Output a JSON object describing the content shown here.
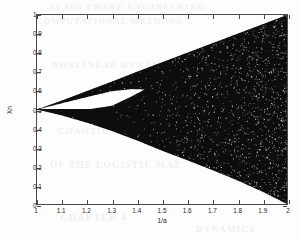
{
  "figure": {
    "background_color": "#fdfdfd",
    "ink_color": "#0d0d0d",
    "axis_color": "#4a4a4a"
  },
  "ghost_text": {
    "line1": "AI SOFTWARE ENGINEERING",
    "line2": "COMPUTATIONAL METHODS",
    "line3": "NONLINEAR DYNAMICS AND",
    "line4": "BIFURCATION",
    "line5": "CHAOTIC BEHAVIOUR",
    "line6": "OF THE LOGISTIC MAP",
    "line7": "CHAPTER 4",
    "line8": "DYNAMICS"
  },
  "chart_data": {
    "type": "scatter",
    "title": "",
    "xlabel": "1/a",
    "ylabel": "Xn",
    "xlim": [
      1,
      2
    ],
    "ylim": [
      0,
      1
    ],
    "grid": false,
    "legend": "none",
    "xticks": [
      1,
      1.1,
      1.2,
      1.3,
      1.4,
      1.5,
      1.6,
      1.7,
      1.8,
      1.9,
      2
    ],
    "xticklabels": [
      "1",
      "1.1",
      "1.2",
      "1.3",
      "1.4",
      "1.5",
      "1.6",
      "1.7",
      "1.8",
      "1.9",
      "2"
    ],
    "yticks": [
      0,
      0.1,
      0.2,
      0.3,
      0.4,
      0.5,
      0.6,
      0.7,
      0.8,
      0.9,
      1
    ],
    "yticklabels": [
      "0",
      "0.1",
      "0.2",
      "0.3",
      "0.4",
      "0.5",
      "0.6",
      "0.7",
      "0.8",
      "0.9",
      "1"
    ],
    "marker_color": "#0d0d0d",
    "upper_envelope": {
      "x": [
        1.0,
        1.1,
        1.2,
        1.3,
        1.4,
        1.5,
        1.6,
        1.7,
        1.8,
        1.9,
        2.0
      ],
      "y": [
        0.5,
        0.548,
        0.598,
        0.648,
        0.7,
        0.75,
        0.8,
        0.85,
        0.9,
        0.95,
        1.0
      ]
    },
    "lower_envelope": {
      "x": [
        1.0,
        1.1,
        1.2,
        1.3,
        1.4,
        1.5,
        1.6,
        1.7,
        1.8,
        1.9,
        2.0
      ],
      "y": [
        0.5,
        0.468,
        0.43,
        0.386,
        0.336,
        0.282,
        0.232,
        0.18,
        0.126,
        0.066,
        0.0
      ]
    },
    "inner_gap": {
      "label": "period-2 window gap",
      "x_start": 1.0,
      "x_close": 1.43,
      "upper": {
        "x": [
          1.0,
          1.1,
          1.2,
          1.3,
          1.38,
          1.43
        ],
        "y": [
          0.5,
          0.533,
          0.566,
          0.597,
          0.608,
          0.606
        ]
      },
      "lower": {
        "x": [
          1.0,
          1.1,
          1.2,
          1.3,
          1.38,
          1.43
        ],
        "y": [
          0.5,
          0.5,
          0.5,
          0.52,
          0.57,
          0.606
        ]
      }
    },
    "speckle_note": "white speckles scattered inside the dark chaotic band, density increasing toward 1/a = 2"
  }
}
